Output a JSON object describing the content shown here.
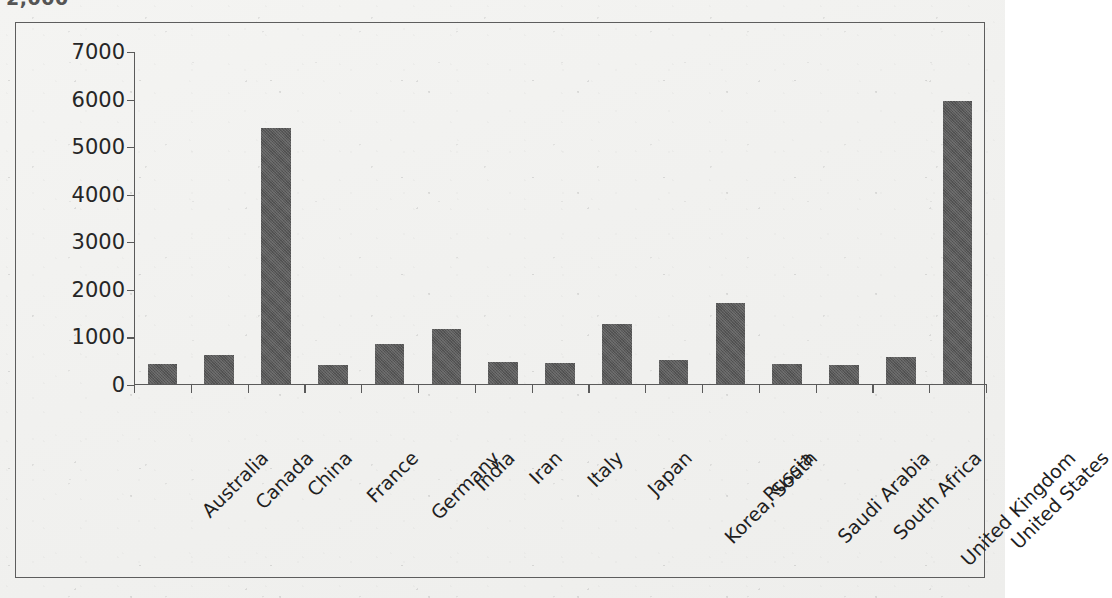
{
  "title_fragment": "2,000",
  "colors": {
    "bar": "#595959",
    "axis": "#5a5a5a",
    "frame": "#5d5d5d",
    "text": "#1f1f1f",
    "paper": "#f2f2f0"
  },
  "chart_data": {
    "type": "bar",
    "title": "",
    "subtitle": "",
    "xlabel": "",
    "ylabel": "",
    "ylim": [
      0,
      7000
    ],
    "yticks": [
      0,
      1000,
      2000,
      3000,
      4000,
      5000,
      6000,
      7000
    ],
    "ytick_labels": [
      "0",
      "1000",
      "2000",
      "3000",
      "4000",
      "5000",
      "6000",
      "7000"
    ],
    "grid": false,
    "legend": false,
    "legend_position": "none",
    "categories": [
      "Australia",
      "Canada",
      "China",
      "France",
      "Germany",
      "India",
      "Iran",
      "Italy",
      "Japan",
      "Korea, South",
      "Russia",
      "Saudi Arabia",
      "South Africa",
      "United Kingdom",
      "United States"
    ],
    "values": [
      420,
      610,
      5380,
      400,
      840,
      1155,
      460,
      445,
      1260,
      505,
      1700,
      425,
      410,
      570,
      5945
    ],
    "series": [
      {
        "name": "Value",
        "values": [
          420,
          610,
          5380,
          400,
          840,
          1155,
          460,
          445,
          1260,
          505,
          1700,
          425,
          410,
          570,
          5945
        ]
      }
    ]
  }
}
